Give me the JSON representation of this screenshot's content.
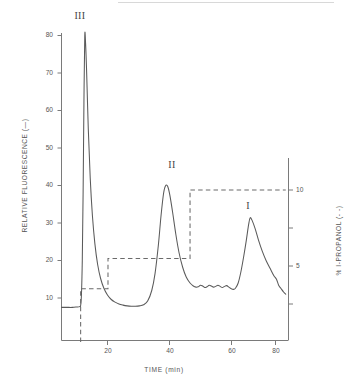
{
  "figure": {
    "type": "chromatogram",
    "xlabel": "TIME (min)",
    "ylabel_left": "RELATIVE FLUORESCENCE (—)",
    "ylabel_right": "% I-PROPANOL (- -)"
  },
  "axes": {
    "y_left_ticks": [
      "80",
      "70",
      "60",
      "50",
      "40",
      "30",
      "20",
      "10"
    ],
    "y_right_ticks": [
      "10",
      "5"
    ],
    "x_ticks": [
      "20",
      "40",
      "60",
      "80"
    ]
  },
  "peak_labels": [
    {
      "name": "peak-label-3",
      "text": "III"
    },
    {
      "name": "peak-label-2",
      "text": "II"
    },
    {
      "name": "peak-label-1",
      "text": "I"
    }
  ],
  "chart_data": {
    "type": "line",
    "title": "",
    "xlabel": "TIME (min)",
    "ylabel": "RELATIVE FLUORESCENCE (—)",
    "ylabel_secondary": "% I-PROPANOL (- -)",
    "xlim": [
      3,
      86
    ],
    "ylim": [
      4,
      83
    ],
    "ylim_secondary": [
      0,
      11.8
    ],
    "grid": false,
    "legend": "none",
    "x_ticks": [
      20,
      40,
      60,
      80
    ],
    "y_ticks": [
      10,
      20,
      30,
      40,
      50,
      60,
      70,
      80
    ],
    "y2_ticks": [
      5,
      10
    ],
    "annotations": [
      {
        "label": "III",
        "x": 11.5,
        "y": 80
      },
      {
        "label": "II",
        "x": 41,
        "y": 40
      },
      {
        "label": "I",
        "x": 72,
        "y": 31.5
      }
    ],
    "series": [
      {
        "name": "Relative fluorescence",
        "style": "solid",
        "axis": "left",
        "color": "#5a5a5a",
        "x": [
          3,
          5,
          7,
          8.5,
          9.6,
          10.0,
          10.3,
          10.6,
          10.9,
          11.2,
          11.5,
          11.8,
          12.2,
          12.8,
          13.5,
          14.3,
          15.2,
          16.2,
          17.3,
          18.5,
          19.8,
          21.2,
          22.6,
          24.0,
          25.5,
          27.0,
          28.5,
          30.0,
          31.5,
          33.0,
          34.5,
          36.0,
          37.2,
          38.4,
          39.4,
          40.3,
          41.0,
          41.8,
          42.6,
          43.6,
          44.8,
          46.0,
          47.3,
          48.6,
          50.0,
          51.2,
          52.2,
          53.0,
          53.8,
          54.6,
          55.4,
          56.2,
          57.0,
          57.8,
          58.6,
          59.4,
          60.2,
          61.0,
          61.8,
          62.6,
          63.4,
          64.2,
          65.0,
          65.8,
          66.6,
          67.6,
          68.6,
          69.6,
          70.6,
          71.4,
          72.0,
          72.8,
          73.8,
          75.0,
          76.4,
          77.8,
          79.2,
          80.6,
          81.6,
          82.4,
          83.2,
          84.2,
          85.0
        ],
        "y": [
          7.5,
          7.5,
          7.5,
          7.6,
          7.7,
          8.0,
          11.0,
          20.0,
          38.0,
          62.0,
          79.8,
          78.0,
          70.0,
          55.0,
          42.0,
          32.0,
          24.5,
          19.0,
          15.2,
          12.6,
          10.8,
          9.6,
          8.9,
          8.4,
          8.1,
          7.9,
          7.8,
          7.8,
          7.9,
          8.2,
          9.2,
          12.0,
          16.5,
          24.0,
          32.0,
          37.8,
          39.9,
          39.8,
          37.5,
          33.0,
          27.0,
          22.0,
          18.2,
          15.6,
          14.0,
          13.2,
          12.9,
          13.0,
          13.4,
          13.2,
          12.8,
          13.0,
          13.4,
          13.2,
          12.9,
          13.1,
          13.4,
          13.1,
          12.8,
          13.1,
          13.3,
          12.9,
          12.5,
          12.3,
          12.6,
          14.0,
          17.0,
          21.0,
          25.5,
          29.5,
          31.4,
          30.5,
          28.5,
          25.5,
          22.5,
          20.0,
          18.0,
          16.0,
          15.0,
          13.4,
          12.6,
          11.6,
          11.0
        ]
      },
      {
        "name": "% I-propanol gradient",
        "style": "dashed",
        "axis": "right",
        "color": "#6a6a6a",
        "x": [
          10.0,
          10.0,
          20.0,
          20.0,
          50.0,
          50.0,
          85.0
        ],
        "y": [
          0.0,
          3.5,
          3.5,
          5.5,
          5.5,
          10.0,
          10.0
        ]
      }
    ]
  }
}
